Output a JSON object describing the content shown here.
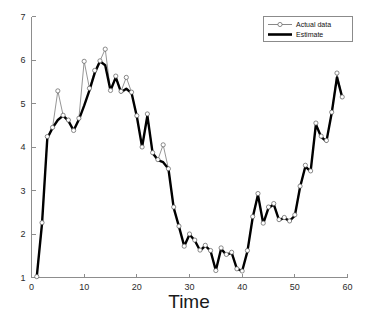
{
  "chart_data": {
    "type": "line",
    "title": "",
    "subtitle": "",
    "xlabel": "Time",
    "ylabel": "",
    "xlim": [
      0,
      60
    ],
    "ylim": [
      1,
      7
    ],
    "grid": false,
    "legend_position": "top-right",
    "xticks": [
      0,
      10,
      20,
      30,
      40,
      50,
      60
    ],
    "xtick_labels": [
      "0",
      "10",
      "20",
      "30",
      "40",
      "50",
      "60"
    ],
    "yticks": [
      1,
      2,
      3,
      4,
      5,
      6,
      7
    ],
    "ytick_labels": [
      "1",
      "2",
      "3",
      "4",
      "5",
      "6",
      "7"
    ],
    "x": [
      1,
      2,
      3,
      4,
      5,
      6,
      7,
      8,
      9,
      10,
      11,
      12,
      13,
      14,
      15,
      16,
      17,
      18,
      19,
      20,
      21,
      22,
      23,
      24,
      25,
      26,
      27,
      28,
      29,
      30,
      31,
      32,
      33,
      34,
      35,
      36,
      37,
      38,
      39,
      40,
      41,
      42,
      43,
      44,
      45,
      46,
      47,
      48,
      49,
      50,
      51,
      52,
      53,
      54,
      55,
      56,
      57,
      58,
      59
    ],
    "series": [
      {
        "name": "Actual data",
        "style": "thin-line-with-open-circle-markers",
        "color": "#7a7a7a",
        "markers": true,
        "values": [
          1.02,
          2.26,
          4.24,
          4.45,
          5.29,
          4.73,
          4.62,
          4.38,
          4.66,
          5.97,
          5.35,
          5.76,
          5.98,
          6.25,
          5.3,
          5.63,
          5.28,
          5.6,
          5.26,
          4.72,
          4.0,
          4.76,
          3.87,
          3.71,
          4.05,
          3.5,
          2.62,
          2.18,
          1.72,
          2.0,
          1.86,
          1.63,
          1.74,
          1.62,
          1.16,
          1.68,
          1.53,
          1.58,
          1.2,
          1.15,
          1.62,
          2.4,
          2.93,
          2.25,
          2.62,
          2.7,
          2.33,
          2.38,
          2.3,
          2.44,
          3.1,
          3.58,
          3.45,
          4.55,
          4.25,
          4.15,
          4.8,
          5.7,
          5.15
        ]
      },
      {
        "name": "Estimate",
        "style": "thick-solid-line",
        "color": "#000000",
        "markers": false,
        "values": [
          1.02,
          2.24,
          4.2,
          4.44,
          4.62,
          4.72,
          4.6,
          4.38,
          4.63,
          4.95,
          5.3,
          5.7,
          5.97,
          5.88,
          5.3,
          5.6,
          5.26,
          5.34,
          5.24,
          4.7,
          4.0,
          4.72,
          3.86,
          3.7,
          3.65,
          3.5,
          2.6,
          2.17,
          1.72,
          1.99,
          1.85,
          1.62,
          1.73,
          1.61,
          1.16,
          1.66,
          1.52,
          1.57,
          1.2,
          1.15,
          1.6,
          2.38,
          2.9,
          2.24,
          2.6,
          2.68,
          2.32,
          2.37,
          2.3,
          2.42,
          3.08,
          3.55,
          3.44,
          4.52,
          4.23,
          4.13,
          4.78,
          5.6,
          5.14
        ]
      }
    ]
  },
  "legend": {
    "entries": [
      {
        "label": "Actual data"
      },
      {
        "label": "Estimate"
      }
    ]
  },
  "axes": {
    "x_title": "Time"
  },
  "colors": {
    "actual": "#7a7a7a",
    "estimate": "#000000",
    "axis": "#8d8d8d",
    "background": "#ffffff"
  }
}
